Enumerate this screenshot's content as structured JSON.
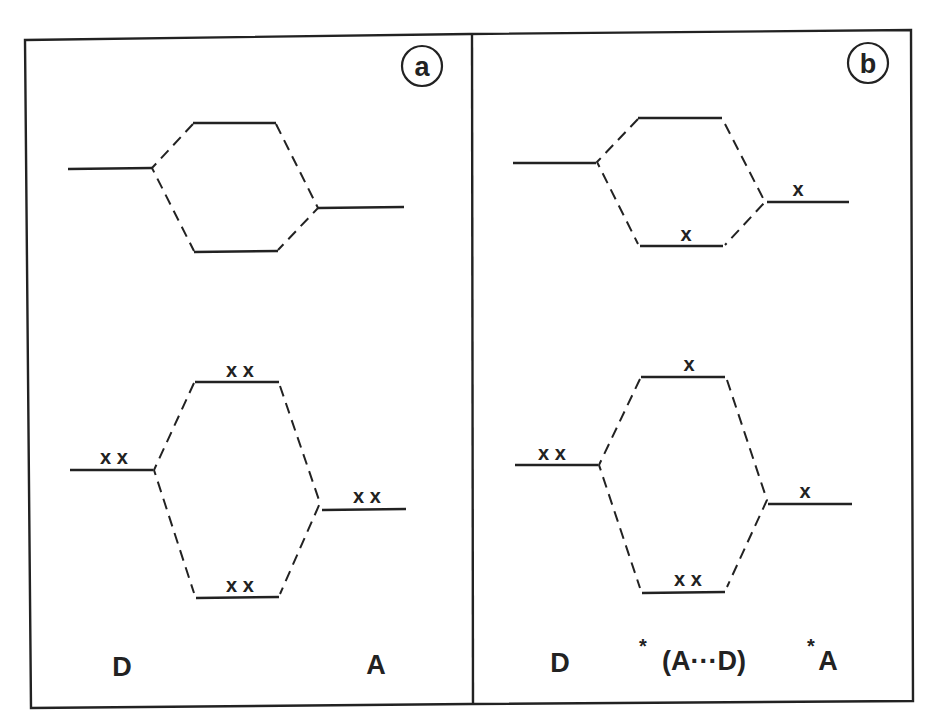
{
  "figure": {
    "type": "orbital-interaction-diagram",
    "panels": [
      {
        "id": "a",
        "badge": "a",
        "labels": {
          "left": "D",
          "middle": "",
          "right": "A"
        },
        "levels": {
          "donor": {
            "electrons": "x x"
          },
          "acceptor": {
            "electrons": "x x"
          },
          "upper_donor": {
            "electrons": ""
          },
          "upper_acceptor": {
            "electrons": ""
          },
          "upper_bonding": {
            "electrons": ""
          },
          "upper_antibonding": {
            "electrons": ""
          },
          "lower_antibonding": {
            "electrons": "x x"
          },
          "lower_bonding": {
            "electrons": "x x"
          }
        }
      },
      {
        "id": "b",
        "badge": "b",
        "labels": {
          "left": "D",
          "middle_star": "*",
          "middle": "(A···D)",
          "right_star": "*",
          "right": "A"
        },
        "levels": {
          "donor": {
            "electrons": "x x"
          },
          "acceptor": {
            "electrons": "x"
          },
          "upper_donor": {
            "electrons": ""
          },
          "upper_acceptor": {
            "electrons": "x"
          },
          "upper_bonding": {
            "electrons": "x"
          },
          "upper_antibonding": {
            "electrons": ""
          },
          "lower_antibonding": {
            "electrons": "x"
          },
          "lower_bonding": {
            "electrons": "x x"
          }
        }
      }
    ]
  }
}
